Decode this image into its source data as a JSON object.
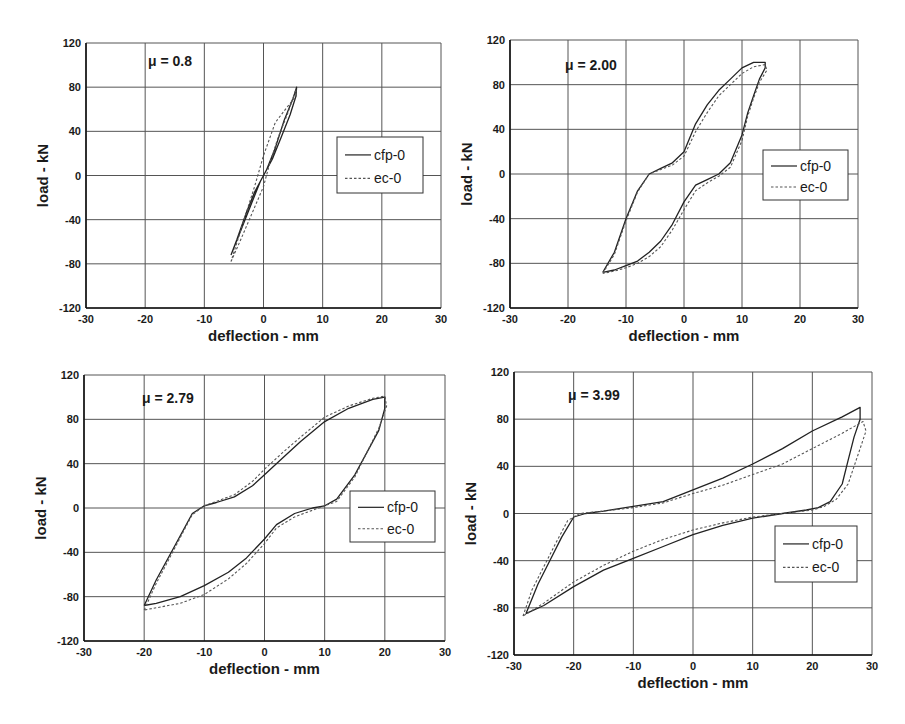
{
  "figure": {
    "panels": [
      {
        "id": "p1",
        "mu_label": "μ = 0.8"
      },
      {
        "id": "p2",
        "mu_label": "μ = 2.00"
      },
      {
        "id": "p3",
        "mu_label": "μ = 2.79"
      },
      {
        "id": "p4",
        "mu_label": "μ = 3.99"
      }
    ],
    "legend": [
      "cfp-0",
      "ec-0"
    ],
    "xlabel": "deflection - mm",
    "ylabel": "load - kN"
  },
  "chart_data": [
    {
      "type": "line",
      "title": "μ = 0.8",
      "xlabel": "deflection - mm",
      "ylabel": "load - kN",
      "xlim": [
        -30,
        30
      ],
      "ylim": [
        -120,
        120
      ],
      "xticks": [
        -30,
        -20,
        -10,
        0,
        10,
        20,
        30
      ],
      "yticks": [
        -120,
        -80,
        -40,
        0,
        40,
        80,
        120
      ],
      "grid": true,
      "legend_position": "right-center",
      "layout": {
        "left": 86,
        "top": 43,
        "width": 355,
        "height": 265,
        "legend": {
          "x": 337,
          "y": 137,
          "w": 86,
          "h": 56
        },
        "mu": {
          "x": 148,
          "y": 66
        }
      },
      "series": [
        {
          "name": "cfp-0",
          "style": "solid",
          "x": [
            -5.5,
            -4,
            -2,
            -0.5,
            0.5,
            2,
            3.5,
            5,
            5.6,
            5.5,
            4.5,
            3,
            1.5,
            0,
            -1.5,
            -3,
            -4.5,
            -5.5
          ],
          "y": [
            -72,
            -52,
            -25,
            -5,
            5,
            25,
            50,
            70,
            80,
            72,
            55,
            35,
            15,
            0,
            -15,
            -35,
            -58,
            -72
          ]
        },
        {
          "name": "ec-0",
          "style": "dashed",
          "x": [
            -5.5,
            -4,
            -2,
            0,
            1,
            2.5,
            4,
            5.5,
            5.5,
            4,
            2,
            0,
            -1.5,
            -3,
            -5.5
          ],
          "y": [
            -78,
            -60,
            -35,
            -10,
            10,
            35,
            55,
            78,
            72,
            62,
            48,
            18,
            -10,
            -35,
            -78
          ]
        }
      ]
    },
    {
      "type": "line",
      "title": "μ = 2.00",
      "xlabel": "deflection - mm",
      "ylabel": "load - kN",
      "xlim": [
        -30,
        30
      ],
      "ylim": [
        -120,
        120
      ],
      "xticks": [
        -30,
        -20,
        -10,
        0,
        10,
        20,
        30
      ],
      "yticks": [
        -120,
        -80,
        -40,
        0,
        40,
        80,
        120
      ],
      "grid": true,
      "legend_position": "right-center",
      "layout": {
        "left": 510,
        "top": 40,
        "width": 348,
        "height": 268,
        "legend": {
          "x": 763,
          "y": 150,
          "w": 85,
          "h": 50
        },
        "mu": {
          "x": 565,
          "y": 70
        }
      },
      "series": [
        {
          "name": "cfp-0",
          "style": "solid",
          "x": [
            -14,
            -12,
            -10,
            -8,
            -6,
            -4,
            -2,
            0,
            2,
            4,
            6,
            8,
            10,
            12,
            14,
            14,
            13,
            12,
            11,
            10,
            8,
            6,
            4,
            2,
            0,
            -2,
            -4,
            -6,
            -8,
            -10,
            -12,
            -14
          ],
          "y": [
            -88,
            -70,
            -40,
            -15,
            0,
            5,
            10,
            20,
            45,
            62,
            75,
            85,
            95,
            100,
            100,
            95,
            85,
            70,
            55,
            35,
            10,
            0,
            -5,
            -10,
            -25,
            -45,
            -60,
            -70,
            -78,
            -82,
            -86,
            -88
          ]
        },
        {
          "name": "ec-0",
          "style": "dashed",
          "x": [
            -14,
            -12,
            -10,
            -8,
            -6,
            -4,
            -2,
            0,
            2,
            4,
            6,
            8,
            10,
            12,
            14,
            14.3,
            13,
            12,
            11,
            10,
            8,
            6,
            4,
            2,
            0,
            -2,
            -4,
            -6,
            -8,
            -10,
            -12,
            -14
          ],
          "y": [
            -89,
            -72,
            -42,
            -16,
            0,
            4,
            8,
            16,
            38,
            55,
            70,
            80,
            90,
            96,
            98,
            93,
            82,
            68,
            52,
            30,
            6,
            -2,
            -8,
            -15,
            -32,
            -50,
            -65,
            -74,
            -80,
            -84,
            -87,
            -89
          ]
        }
      ]
    },
    {
      "type": "line",
      "title": "μ = 2.79",
      "xlabel": "deflection - mm",
      "ylabel": "load - kN",
      "xlim": [
        -30,
        30
      ],
      "ylim": [
        -120,
        120
      ],
      "xticks": [
        -30,
        -20,
        -10,
        0,
        10,
        20,
        30
      ],
      "yticks": [
        -120,
        -80,
        -40,
        0,
        40,
        80,
        120
      ],
      "grid": true,
      "legend_position": "right-center",
      "layout": {
        "left": 84,
        "top": 375,
        "width": 361,
        "height": 266,
        "legend": {
          "x": 350,
          "y": 491,
          "w": 85,
          "h": 51
        },
        "mu": {
          "x": 142,
          "y": 403
        }
      },
      "series": [
        {
          "name": "cfp-0",
          "style": "solid",
          "x": [
            -20,
            -18,
            -15,
            -12,
            -10,
            -8,
            -5,
            -2,
            0,
            3,
            6,
            10,
            14,
            18,
            20,
            20,
            19,
            17,
            15,
            12,
            10,
            8,
            5,
            2,
            0,
            -3,
            -6,
            -10,
            -14,
            -18,
            -20
          ],
          "y": [
            -88,
            -65,
            -35,
            -5,
            2,
            5,
            10,
            20,
            30,
            45,
            60,
            78,
            90,
            98,
            100,
            90,
            70,
            50,
            30,
            8,
            2,
            0,
            -5,
            -15,
            -28,
            -45,
            -58,
            -70,
            -80,
            -86,
            -88
          ]
        },
        {
          "name": "ec-0",
          "style": "dashed",
          "x": [
            -20,
            -18,
            -15,
            -12,
            -10,
            -8,
            -5,
            -2,
            0,
            3,
            6,
            10,
            14,
            18,
            20,
            20.3,
            19,
            17,
            15,
            12,
            10,
            8,
            5,
            2,
            0,
            -3,
            -6,
            -10,
            -14,
            -18,
            -20
          ],
          "y": [
            -92,
            -68,
            -37,
            -6,
            2,
            6,
            12,
            24,
            35,
            50,
            64,
            82,
            92,
            99,
            101,
            92,
            72,
            50,
            28,
            6,
            2,
            -2,
            -8,
            -18,
            -32,
            -50,
            -64,
            -78,
            -86,
            -90,
            -92
          ]
        }
      ]
    },
    {
      "type": "line",
      "title": "μ = 3.99",
      "xlabel": "deflection - mm",
      "ylabel": "load - kN",
      "xlim": [
        -30,
        30
      ],
      "ylim": [
        -120,
        120
      ],
      "xticks": [
        -30,
        -20,
        -10,
        0,
        10,
        20,
        30
      ],
      "yticks": [
        -120,
        -80,
        -40,
        0,
        40,
        80,
        120
      ],
      "grid": true,
      "legend_position": "right-center",
      "layout": {
        "left": 514,
        "top": 372,
        "width": 358,
        "height": 283,
        "legend": {
          "x": 775,
          "y": 526,
          "w": 82,
          "h": 56
        },
        "mu": {
          "x": 568,
          "y": 400
        }
      },
      "series": [
        {
          "name": "cfp-0",
          "style": "solid",
          "x": [
            -28,
            -26,
            -24,
            -22,
            -20,
            -18,
            -15,
            -10,
            -5,
            0,
            5,
            10,
            15,
            20,
            25,
            28,
            28,
            27,
            26,
            25,
            23,
            21,
            19,
            15,
            10,
            5,
            0,
            -5,
            -10,
            -15,
            -20,
            -25,
            -28
          ],
          "y": [
            -85,
            -60,
            -40,
            -20,
            -3,
            0,
            2,
            6,
            10,
            20,
            30,
            42,
            55,
            70,
            82,
            90,
            80,
            65,
            45,
            25,
            10,
            5,
            3,
            0,
            -4,
            -10,
            -18,
            -28,
            -38,
            -48,
            -62,
            -78,
            -85
          ]
        },
        {
          "name": "ec-0",
          "style": "dashed",
          "x": [
            -28.5,
            -27,
            -25,
            -23,
            -21,
            -19,
            -15,
            -10,
            -5,
            0,
            5,
            10,
            15,
            20,
            25,
            28.5,
            29,
            28,
            27,
            26,
            24,
            22,
            20,
            15,
            10,
            5,
            0,
            -5,
            -10,
            -15,
            -20,
            -25,
            -28.5
          ],
          "y": [
            -87,
            -65,
            -45,
            -25,
            -6,
            0,
            2,
            5,
            9,
            17,
            24,
            33,
            42,
            55,
            68,
            78,
            70,
            55,
            40,
            25,
            12,
            6,
            3,
            0,
            -3,
            -8,
            -14,
            -22,
            -32,
            -44,
            -58,
            -76,
            -87
          ]
        }
      ]
    }
  ]
}
